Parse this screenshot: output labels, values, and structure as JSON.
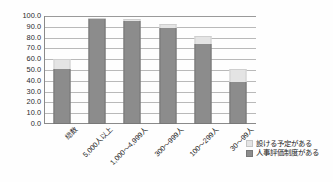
{
  "chart_data": {
    "type": "bar",
    "stacked": true,
    "title": "",
    "subtitle": "",
    "xlabel": "",
    "ylabel": "",
    "ylim": [
      0.0,
      100.0
    ],
    "ytick_step": 10.0,
    "grid": true,
    "legend_position": "bottom-right",
    "categories": [
      "総数",
      "5,000人以上",
      "1,000〜4,999人",
      "300〜999人",
      "100〜299人",
      "30〜99人"
    ],
    "yticks": [
      "0.0",
      "10.0",
      "20.0",
      "30.0",
      "40.0",
      "50.0",
      "60.0",
      "70.0",
      "80.0",
      "90.0",
      "100.0"
    ],
    "series": [
      {
        "name": "人事評価制度がある",
        "color": "#8c8c8c",
        "values": [
          51.0,
          97.0,
          95.5,
          89.0,
          74.0,
          39.0
        ]
      },
      {
        "name": "設ける予定がある",
        "color": "#e4e4e4",
        "values": [
          9.5,
          1.5,
          2.0,
          4.0,
          7.5,
          11.5
        ]
      }
    ]
  },
  "legend": {
    "items": [
      {
        "label": "設ける予定がある",
        "swatch": "plan"
      },
      {
        "label": "人事評価制度がある",
        "swatch": "have"
      }
    ]
  },
  "colors": {
    "series_dark": "#8c8c8c",
    "series_light": "#e4e4e4",
    "axis": "#8a8a8a",
    "grid": "#b9b9b9",
    "text": "#1f1f1f",
    "background": "#ffffff"
  }
}
